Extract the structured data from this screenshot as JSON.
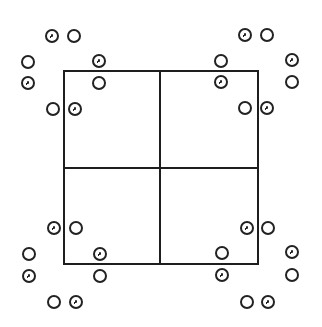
{
  "diagram": {
    "type": "2x2 grid with corner circle groups",
    "stroke_color": "#1e1e1e",
    "background": "#ffffff",
    "square": {
      "left": 64,
      "top": 71,
      "right": 258,
      "bottom": 264
    },
    "center": {
      "x": 160,
      "y": 168
    },
    "circle_radius": 6,
    "circles": [
      {
        "x": 52,
        "y": 36,
        "marked": true
      },
      {
        "x": 74,
        "y": 36,
        "marked": false
      },
      {
        "x": 28,
        "y": 62,
        "marked": false
      },
      {
        "x": 99,
        "y": 61,
        "marked": true
      },
      {
        "x": 28,
        "y": 83,
        "marked": true
      },
      {
        "x": 99,
        "y": 83,
        "marked": false
      },
      {
        "x": 53,
        "y": 109,
        "marked": false
      },
      {
        "x": 75,
        "y": 109,
        "marked": true
      },
      {
        "x": 245,
        "y": 35,
        "marked": true
      },
      {
        "x": 267,
        "y": 35,
        "marked": false
      },
      {
        "x": 221,
        "y": 61,
        "marked": false
      },
      {
        "x": 292,
        "y": 60,
        "marked": true
      },
      {
        "x": 221,
        "y": 82,
        "marked": true
      },
      {
        "x": 292,
        "y": 82,
        "marked": false
      },
      {
        "x": 245,
        "y": 108,
        "marked": false
      },
      {
        "x": 267,
        "y": 108,
        "marked": true
      },
      {
        "x": 54,
        "y": 228,
        "marked": true
      },
      {
        "x": 76,
        "y": 228,
        "marked": false
      },
      {
        "x": 29,
        "y": 254,
        "marked": false
      },
      {
        "x": 100,
        "y": 254,
        "marked": true
      },
      {
        "x": 29,
        "y": 276,
        "marked": true
      },
      {
        "x": 100,
        "y": 276,
        "marked": false
      },
      {
        "x": 54,
        "y": 302,
        "marked": false
      },
      {
        "x": 76,
        "y": 302,
        "marked": true
      },
      {
        "x": 247,
        "y": 228,
        "marked": true
      },
      {
        "x": 268,
        "y": 228,
        "marked": false
      },
      {
        "x": 222,
        "y": 253,
        "marked": false
      },
      {
        "x": 292,
        "y": 252,
        "marked": true
      },
      {
        "x": 222,
        "y": 275,
        "marked": true
      },
      {
        "x": 292,
        "y": 275,
        "marked": false
      },
      {
        "x": 247,
        "y": 302,
        "marked": false
      },
      {
        "x": 268,
        "y": 302,
        "marked": true
      }
    ]
  }
}
